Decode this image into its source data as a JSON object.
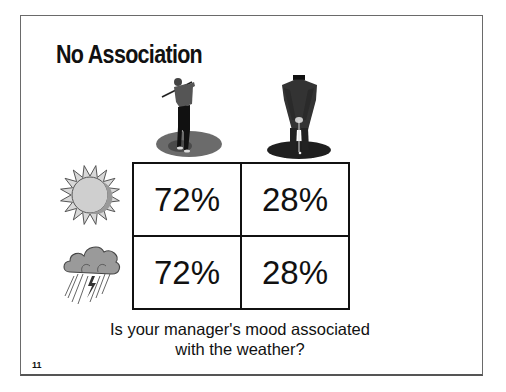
{
  "slide": {
    "title": "No Association",
    "page_number": "11",
    "caption": {
      "line1": "Is your manager's mood associated",
      "line2": "with the weather?"
    }
  },
  "column_headers": [
    {
      "icon": "golfer-swinging-icon",
      "meaning": "good mood"
    },
    {
      "icon": "golfer-putting-icon",
      "meaning": "bad mood"
    }
  ],
  "row_headers": [
    {
      "icon": "sun-icon",
      "meaning": "sunny weather"
    },
    {
      "icon": "rain-cloud-icon",
      "meaning": "rainy weather"
    }
  ],
  "table": {
    "rows": [
      [
        "72%",
        "28%"
      ],
      [
        "72%",
        "28%"
      ]
    ]
  },
  "colors": {
    "border": "#111111",
    "frame": "#6a6a6a",
    "sun_fill": "#c8c8c8",
    "cloud_fill": "#9a9a9a"
  }
}
